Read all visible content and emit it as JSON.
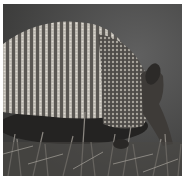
{
  "image": {
    "subject": "armadillo",
    "description": "Grayscale photo of a nine-banded armadillo foraging in grass, viewed from the side",
    "colors": {
      "background": "#444443",
      "shell_light": "#b8b4ae",
      "shell_dark": "#3a3836",
      "grass": "#5c5a56",
      "border": "#ffffff"
    }
  }
}
